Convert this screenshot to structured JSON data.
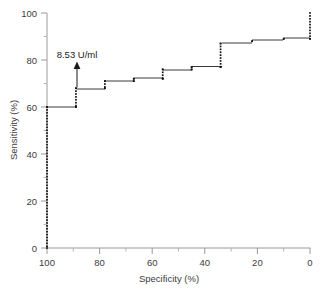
{
  "chart_data": {
    "type": "line",
    "title": "",
    "xlabel": "Specificity (%)",
    "ylabel": "Sensitivity (%)",
    "xlim": [
      100,
      0
    ],
    "ylim": [
      0,
      100
    ],
    "x_reversed": true,
    "grid": false,
    "legend": null,
    "xticks": [
      "100",
      "80",
      "60",
      "40",
      "20",
      "0"
    ],
    "xtick_values": [
      100,
      80,
      60,
      40,
      20,
      0
    ],
    "yticks": [
      "0",
      "20",
      "40",
      "60",
      "80",
      "100"
    ],
    "ytick_values": [
      0,
      20,
      40,
      60,
      80,
      100
    ],
    "minor_ticks": true,
    "series": [
      {
        "name": "ROC curve",
        "specificity": [
          100,
          100,
          89,
          89,
          78,
          78,
          67,
          67,
          56,
          56,
          45,
          45,
          34,
          34,
          22,
          10,
          0,
          0
        ],
        "sensitivity": [
          0,
          60,
          60,
          68,
          68,
          71,
          71,
          72,
          72,
          76,
          76,
          77,
          77,
          87,
          88,
          89,
          89,
          100
        ],
        "step_style": "post",
        "markers": "dotted-square",
        "marker_color": "#111111",
        "line_color": "#3a3a3a"
      }
    ],
    "annotations": [
      {
        "text": "8.53 U/ml",
        "type": "arrow-up",
        "point_specificity": 89,
        "point_sensitivity": 68,
        "label_specificity": 89,
        "label_sensitivity": 82
      }
    ]
  },
  "axes": {
    "x_title": "Specificity (%)",
    "y_title": "Sensitivity (%)"
  },
  "colors": {
    "axis": "#9a9a9a",
    "curve": "#3a3a3a",
    "marker": "#111111",
    "text": "#3c3c3c",
    "background": "#ffffff"
  }
}
